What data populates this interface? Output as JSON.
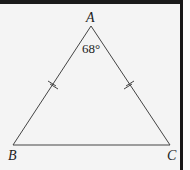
{
  "diagram": {
    "type": "isosceles-triangle",
    "vertices": {
      "A": {
        "label": "A",
        "x": 91,
        "y": 26
      },
      "B": {
        "label": "B",
        "x": 13,
        "y": 145
      },
      "C": {
        "label": "C",
        "x": 170,
        "y": 145
      }
    },
    "apex_angle": "68°",
    "congruent_sides": [
      "AB",
      "AC"
    ],
    "tick_marks_per_side": 2,
    "colors": {
      "stroke": "#444444",
      "background": "#f4f4f4",
      "border": "#1a1a1a"
    }
  }
}
